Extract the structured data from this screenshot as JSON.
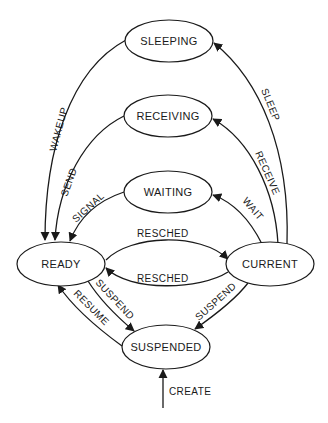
{
  "diagram": {
    "type": "state-transition",
    "colors": {
      "line": "#1a1a1a",
      "background": "#ffffff"
    },
    "states": [
      {
        "id": "sleeping",
        "label": "SLEEPING"
      },
      {
        "id": "receiving",
        "label": "RECEIVING"
      },
      {
        "id": "waiting",
        "label": "WAITING"
      },
      {
        "id": "ready",
        "label": "READY"
      },
      {
        "id": "current",
        "label": "CURRENT"
      },
      {
        "id": "suspended",
        "label": "SUSPENDED"
      }
    ],
    "transitions": [
      {
        "from": "sleeping",
        "to": "ready",
        "label": "WAKEUP"
      },
      {
        "from": "receiving",
        "to": "ready",
        "label": "SEND"
      },
      {
        "from": "waiting",
        "to": "ready",
        "label": "SIGNAL"
      },
      {
        "from": "current",
        "to": "sleeping",
        "label": "SLEEP"
      },
      {
        "from": "current",
        "to": "receiving",
        "label": "RECEIVE"
      },
      {
        "from": "current",
        "to": "waiting",
        "label": "WAIT"
      },
      {
        "from": "ready",
        "to": "current",
        "label": "RESCHED"
      },
      {
        "from": "current",
        "to": "ready",
        "label": "RESCHED"
      },
      {
        "from": "ready",
        "to": "suspended",
        "label": "SUSPEND"
      },
      {
        "from": "current",
        "to": "suspended",
        "label": "SUSPEND"
      },
      {
        "from": "suspended",
        "to": "ready",
        "label": "RESUME"
      },
      {
        "from": "external",
        "to": "suspended",
        "label": "CREATE"
      }
    ]
  }
}
